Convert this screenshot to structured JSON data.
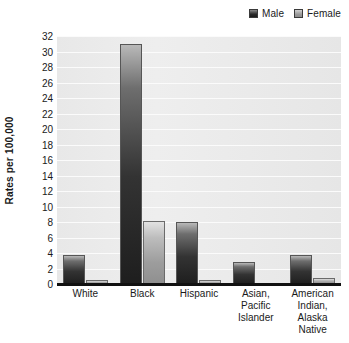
{
  "legend": {
    "position": "top-right",
    "entries": [
      {
        "label": "Male",
        "color": "#2a2a2a",
        "icon": "square-swatch-icon"
      },
      {
        "label": "Female",
        "color": "#9a9a9a",
        "icon": "square-swatch-icon"
      }
    ]
  },
  "chart_data": {
    "type": "bar",
    "title": "",
    "xlabel": "",
    "ylabel": "Rates per 100,000",
    "ylim": [
      0,
      32
    ],
    "ytick_step": 2,
    "yticks": [
      0,
      2,
      4,
      6,
      8,
      10,
      12,
      14,
      16,
      18,
      20,
      22,
      24,
      26,
      28,
      30,
      32
    ],
    "grid": true,
    "legend_position": "top-right",
    "categories": [
      "White",
      "Black",
      "Hispanic",
      "Asian, Pacific Islander",
      "American Indian, Alaska Native"
    ],
    "category_label_lines": [
      [
        "White"
      ],
      [
        "Black"
      ],
      [
        "Hispanic"
      ],
      [
        "Asian,",
        "Pacific",
        "Islander"
      ],
      [
        "American",
        "Indian,",
        "Alaska Native"
      ]
    ],
    "series": [
      {
        "name": "Male",
        "color": "#2a2a2a",
        "values": [
          3.8,
          31.0,
          8.0,
          2.9,
          3.7
        ]
      },
      {
        "name": "Female",
        "color": "#9a9a9a",
        "values": [
          0.5,
          8.1,
          0.5,
          0.1,
          0.8
        ]
      }
    ]
  }
}
